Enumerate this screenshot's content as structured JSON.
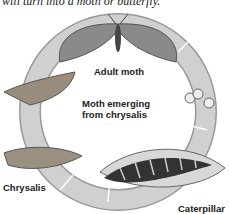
{
  "caption": "will turn into a moth or butterfly.",
  "labels": {
    "adult": "Adult moth",
    "emerging_line1": "Moth emerging",
    "emerging_line2": "from chrysalis",
    "chrysalis": "Chrysalis",
    "caterpillar": "Caterpillar"
  },
  "colors": {
    "ring": "#c8c8c8",
    "ring_edge": "#888888"
  }
}
